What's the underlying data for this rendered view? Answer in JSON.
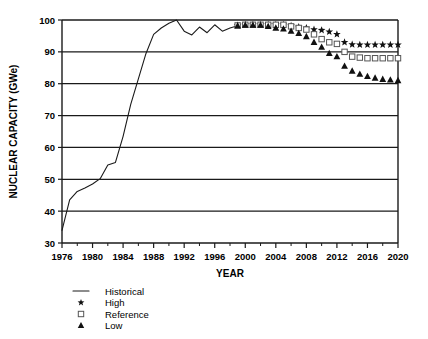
{
  "chart_data": {
    "type": "line",
    "title": "",
    "xlabel": "YEAR",
    "ylabel": "NUCLEAR CAPACITY (GWe)",
    "xlim": [
      1976,
      2020
    ],
    "ylim": [
      30,
      100
    ],
    "xticks": [
      1976,
      1980,
      1984,
      1988,
      1992,
      1996,
      2000,
      2004,
      2008,
      2012,
      2016,
      2020
    ],
    "xtick_labels": [
      "1976",
      "1980",
      "1984",
      "1988",
      "1992",
      "1996",
      "2000",
      "2004",
      "2008",
      "2012",
      "2016",
      "2020"
    ],
    "yticks": [
      30,
      40,
      50,
      60,
      70,
      80,
      90,
      100
    ],
    "ytick_labels": [
      "30",
      "40",
      "50",
      "60",
      "70",
      "80",
      "90",
      "100"
    ],
    "grid": "horizontal",
    "legend_position": "below-left",
    "series": [
      {
        "name": "Historical",
        "marker": "line",
        "style": "solid-line",
        "x": [
          1976,
          1977,
          1978,
          1979,
          1980,
          1981,
          1982,
          1983,
          1984,
          1985,
          1986,
          1987,
          1988,
          1989,
          1990,
          1991,
          1992,
          1993,
          1994,
          1995,
          1996,
          1997,
          1998,
          1999
        ],
        "values": [
          34.0,
          43.5,
          46.2,
          47.3,
          48.5,
          50.2,
          54.5,
          55.3,
          63.5,
          73.5,
          81.5,
          89.5,
          95.5,
          97.5,
          99.0,
          100.0,
          96.5,
          95.3,
          97.8,
          96.0,
          98.5,
          96.5,
          97.5,
          98.2
        ]
      },
      {
        "name": "High",
        "marker": "star",
        "style": "markers",
        "x": [
          1999,
          2000,
          2001,
          2002,
          2003,
          2004,
          2005,
          2006,
          2007,
          2008,
          2009,
          2010,
          2011,
          2012,
          2013,
          2014,
          2015,
          2016,
          2017,
          2018,
          2019,
          2020
        ],
        "values": [
          98.3,
          98.5,
          98.5,
          98.5,
          98.5,
          98.5,
          98.5,
          98.2,
          97.8,
          97.5,
          97.0,
          96.8,
          96.3,
          95.5,
          93.0,
          92.3,
          92.2,
          92.2,
          92.2,
          92.2,
          92.2,
          92.2
        ]
      },
      {
        "name": "Reference",
        "marker": "open-square",
        "style": "markers",
        "x": [
          1999,
          2000,
          2001,
          2002,
          2003,
          2004,
          2005,
          2006,
          2007,
          2008,
          2009,
          2010,
          2011,
          2012,
          2013,
          2014,
          2015,
          2016,
          2017,
          2018,
          2019,
          2020
        ],
        "values": [
          98.3,
          98.5,
          98.5,
          98.5,
          98.5,
          98.5,
          98.5,
          98.0,
          97.5,
          97.0,
          95.5,
          94.0,
          93.0,
          92.5,
          90.0,
          88.5,
          88.2,
          88.0,
          88.0,
          88.0,
          88.0,
          88.0
        ]
      },
      {
        "name": "Low",
        "marker": "filled-triangle",
        "style": "markers",
        "x": [
          1999,
          2000,
          2001,
          2002,
          2003,
          2004,
          2005,
          2006,
          2007,
          2008,
          2009,
          2010,
          2011,
          2012,
          2013,
          2014,
          2015,
          2016,
          2017,
          2018,
          2019,
          2020
        ],
        "values": [
          98.2,
          98.4,
          98.4,
          98.4,
          98.0,
          97.5,
          97.2,
          96.5,
          95.8,
          94.8,
          93.0,
          91.5,
          89.5,
          88.5,
          85.5,
          84.0,
          83.0,
          82.3,
          81.8,
          81.4,
          81.2,
          81.0
        ]
      }
    ],
    "legend": [
      {
        "label": "Historical",
        "marker": "line"
      },
      {
        "label": "High",
        "marker": "star"
      },
      {
        "label": "Reference",
        "marker": "open-square"
      },
      {
        "label": "Low",
        "marker": "filled-triangle"
      }
    ],
    "colors": {
      "axis": "#1a1a1a",
      "grid": "#1a1a1a",
      "historical": "#1a1a1a",
      "high": "#111111",
      "reference": "#555555",
      "low": "#111111",
      "background": "#ffffff"
    }
  }
}
